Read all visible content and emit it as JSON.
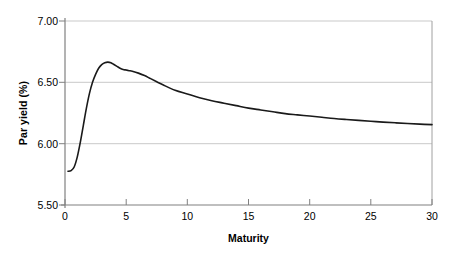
{
  "chart_data": {
    "type": "line",
    "title": "",
    "xlabel": "Maturity",
    "ylabel": "Par yield (%)",
    "xlim": [
      0,
      30
    ],
    "ylim": [
      5.5,
      7.0
    ],
    "xticks": [
      0,
      5,
      10,
      15,
      20,
      25,
      30
    ],
    "xtick_labels": [
      "0",
      "5",
      "10",
      "15",
      "20",
      "25",
      "30"
    ],
    "yticks": [
      5.5,
      6.0,
      6.5,
      7.0
    ],
    "ytick_labels": [
      "5.50",
      "6.00",
      "6.50",
      "7.00"
    ],
    "grid": "horizontal",
    "legend": "none",
    "series": [
      {
        "name": "Par yield curve",
        "color": "#1a1a1a",
        "x": [
          0.25,
          0.5,
          0.75,
          1.0,
          1.25,
          1.5,
          1.75,
          2.0,
          2.25,
          2.5,
          2.75,
          3.0,
          3.25,
          3.5,
          3.75,
          4.0,
          4.25,
          4.5,
          4.75,
          5.0,
          5.25,
          5.5,
          6.0,
          6.5,
          7.0,
          7.5,
          8.0,
          9.0,
          10.0,
          11.0,
          12.0,
          13.0,
          14.0,
          15.0,
          16.0,
          17.0,
          18.0,
          19.0,
          20.0,
          21.0,
          22.0,
          23.0,
          24.0,
          25.0,
          26.0,
          27.0,
          28.0,
          29.0,
          30.0
        ],
        "y": [
          5.775,
          5.78,
          5.81,
          5.89,
          6.01,
          6.15,
          6.29,
          6.41,
          6.5,
          6.565,
          6.615,
          6.645,
          6.66,
          6.665,
          6.66,
          6.645,
          6.63,
          6.615,
          6.605,
          6.6,
          6.595,
          6.59,
          6.575,
          6.555,
          6.53,
          6.505,
          6.48,
          6.435,
          6.405,
          6.375,
          6.35,
          6.33,
          6.31,
          6.29,
          6.275,
          6.26,
          6.245,
          6.235,
          6.225,
          6.215,
          6.205,
          6.197,
          6.19,
          6.183,
          6.176,
          6.17,
          6.164,
          6.159,
          6.155
        ]
      }
    ]
  },
  "axes": {
    "plot_left_px": 65,
    "plot_right_px": 432,
    "plot_top_px": 21,
    "plot_bottom_px": 205,
    "axis_color": "#7a7a7a",
    "grid_color": "#c8c8c8",
    "background": "#ffffff"
  }
}
